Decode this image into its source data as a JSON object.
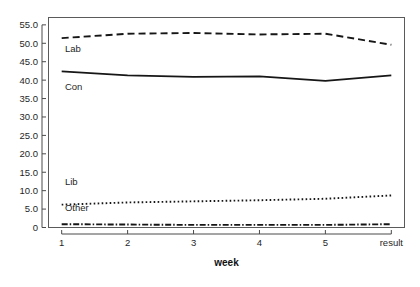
{
  "chart_data": {
    "type": "line",
    "title": "",
    "subtitle": "",
    "xlabel": "week",
    "ylabel": "",
    "categories": [
      "1",
      "2",
      "3",
      "4",
      "5",
      "result"
    ],
    "x": [
      1,
      2,
      3,
      4,
      5,
      6
    ],
    "xtick_labels": [
      "1",
      "2",
      "3",
      "4",
      "5",
      "result"
    ],
    "ytick_labels": [
      "0",
      "5.0",
      "10.0",
      "15.0",
      "20.0",
      "25.0",
      "30.0",
      "35.0",
      "40.0",
      "45.0",
      "50.0",
      "55.0"
    ],
    "ytick_values": [
      0,
      5,
      10,
      15,
      20,
      25,
      30,
      35,
      40,
      45,
      50,
      55
    ],
    "ylim": [
      0,
      57
    ],
    "xlim": [
      0.8,
      6.2
    ],
    "grid": false,
    "legend_position": "inline-left",
    "series": [
      {
        "name": "Lab",
        "label": "Lab",
        "style": "dashed",
        "color": "#161616",
        "width": 1.9,
        "dash": "7,4",
        "values": [
          51.4,
          52.6,
          52.8,
          52.4,
          52.6,
          49.6
        ],
        "label_x": 1.05,
        "label_y": 47.6
      },
      {
        "name": "Con",
        "label": "Con",
        "style": "solid",
        "color": "#161616",
        "width": 1.7,
        "dash": "",
        "values": [
          42.4,
          41.3,
          40.9,
          41.0,
          39.8,
          41.3
        ],
        "label_x": 1.05,
        "label_y": 37.4
      },
      {
        "name": "Lib",
        "label": "Lib",
        "style": "dotted",
        "color": "#161616",
        "width": 1.9,
        "dash": "1.6,2.4",
        "values": [
          6.2,
          6.8,
          7.1,
          7.4,
          7.8,
          8.7
        ],
        "label_x": 1.05,
        "label_y": 11.6
      },
      {
        "name": "Other",
        "label": "Other",
        "style": "dashdot",
        "color": "#161616",
        "width": 1.9,
        "dash": "6,2,1.5,2",
        "values": [
          0.9,
          0.8,
          0.7,
          0.7,
          0.7,
          0.9
        ],
        "label_x": 1.05,
        "label_y": 4.6
      }
    ],
    "colors": {
      "background": "#ffffff",
      "frame": "#5a5a5a",
      "axis": "#4a4a4a",
      "text": "#1f1f1f",
      "line": "#161616"
    }
  }
}
